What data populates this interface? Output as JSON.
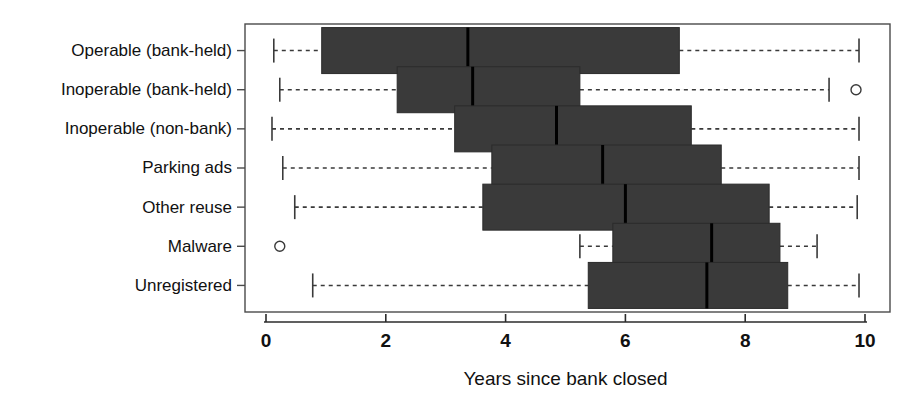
{
  "chart_data": {
    "type": "boxplot",
    "title": "",
    "xlabel": "Years since bank closed",
    "ylabel": "",
    "xlim": [
      -0.35,
      10.35
    ],
    "xticks": [
      0,
      2,
      4,
      6,
      8,
      10
    ],
    "xtick_labels": [
      "0",
      "2",
      "4",
      "6",
      "8",
      "10"
    ],
    "grid": false,
    "legend": "none",
    "orientation": "horizontal",
    "categories": [
      "Operable (bank-held)",
      "Inoperable (bank-held)",
      "Inoperable (non-bank)",
      "Parking ads",
      "Other reuse",
      "Malware",
      "Unregistered"
    ],
    "boxes": [
      {
        "category": "Operable (bank-held)",
        "whisker_low": 0.13,
        "q1": 0.93,
        "median": 3.37,
        "q3": 6.9,
        "whisker_high": 9.9,
        "outliers": []
      },
      {
        "category": "Inoperable (bank-held)",
        "whisker_low": 0.23,
        "q1": 2.19,
        "median": 3.45,
        "q3": 5.24,
        "whisker_high": 9.4,
        "outliers": [
          9.85
        ]
      },
      {
        "category": "Inoperable (non-bank)",
        "whisker_low": 0.1,
        "q1": 3.15,
        "median": 4.85,
        "q3": 7.1,
        "whisker_high": 9.9,
        "outliers": []
      },
      {
        "category": "Parking ads",
        "whisker_low": 0.28,
        "q1": 3.77,
        "median": 5.62,
        "q3": 7.6,
        "whisker_high": 9.9,
        "outliers": []
      },
      {
        "category": "Other reuse",
        "whisker_low": 0.48,
        "q1": 3.62,
        "median": 6.0,
        "q3": 8.4,
        "whisker_high": 9.87,
        "outliers": []
      },
      {
        "category": "Malware",
        "whisker_low": 5.24,
        "q1": 5.79,
        "median": 7.44,
        "q3": 8.58,
        "whisker_high": 9.2,
        "outliers": [
          0.23
        ]
      },
      {
        "category": "Unregistered",
        "whisker_low": 0.78,
        "q1": 5.38,
        "median": 7.36,
        "q3": 8.71,
        "whisker_high": 9.9,
        "outliers": []
      }
    ]
  }
}
